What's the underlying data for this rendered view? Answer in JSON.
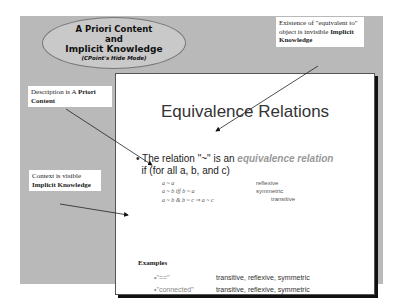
{
  "header": {
    "line1": "A Priori Content",
    "line2": "and",
    "line3": "Implicit Knowledge",
    "line4": "(CPoint's Hide Mode)"
  },
  "callouts": {
    "top_right": {
      "text": "Existence of \"equivalent to\" object is invisible ",
      "bold": "Implicit Knowledge"
    },
    "left_top": {
      "text": "Description is A ",
      "bold": "Priori Content"
    },
    "left_bottom": {
      "text": "Context is visible ",
      "bold": "Implicit Knowledge"
    }
  },
  "slide": {
    "title": "Equivalence Relations",
    "bullet_pre": "The relation \"~\" is an ",
    "bullet_em": "equivalence relation",
    "bullet_line2": "if (for all a, b, and c)",
    "rules": [
      {
        "formula": "a ~ a",
        "name": "reflexive"
      },
      {
        "formula": "a ~ b iff b ~ a",
        "name": "symmetric"
      },
      {
        "formula": "a ~ b & b ~ c ⇒ a ~ c",
        "name": "transitive"
      }
    ],
    "examples_heading": "Examples",
    "examples": [
      {
        "key": "•\"==\"",
        "value": "transitive, reflexive, symmetric"
      },
      {
        "key": "•\"connected\"",
        "value": "transitive, reflexive, symmetric"
      }
    ]
  }
}
